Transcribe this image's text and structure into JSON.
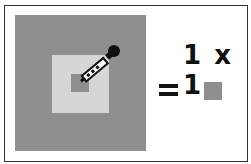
{
  "diagram": {
    "sample_size_label": "1 x 1",
    "equals_symbol": "=",
    "colors": {
      "outer_area": "#8f8f8f",
      "highlight_area": "#d6d6d6",
      "sampled_pixel": "#8f8f8f",
      "result_swatch": "#8f8f8f",
      "border": "#333333"
    },
    "icons": [
      "eyedropper-icon"
    ]
  }
}
